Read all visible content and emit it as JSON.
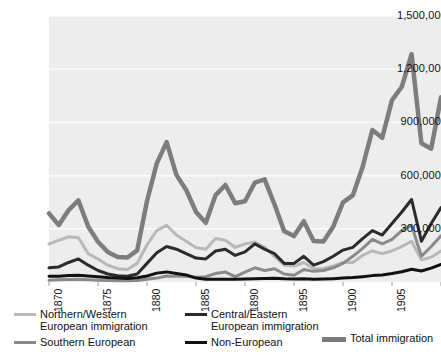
{
  "chart_data": {
    "type": "line",
    "title": "",
    "xlabel": "",
    "ylabel": "",
    "xlim": [
      1870,
      1910
    ],
    "ylim": [
      0,
      1500000
    ],
    "grid": true,
    "legend_position": "bottom",
    "y_ticks": [
      "1,500,000",
      "1,200,000",
      "900,000",
      "600,000",
      "300,000"
    ],
    "y_tick_values": [
      1500000,
      1200000,
      900000,
      600000,
      300000
    ],
    "x_ticks": [
      "1870",
      "1875",
      "1880",
      "1885",
      "1890",
      "1895",
      "1900",
      "1905",
      "1910"
    ],
    "x_tick_values": [
      1870,
      1875,
      1880,
      1885,
      1890,
      1895,
      1900,
      1905,
      1910
    ],
    "x": [
      1870,
      1871,
      1872,
      1873,
      1874,
      1875,
      1876,
      1877,
      1878,
      1879,
      1880,
      1881,
      1882,
      1883,
      1884,
      1885,
      1886,
      1887,
      1888,
      1889,
      1890,
      1891,
      1892,
      1893,
      1894,
      1895,
      1896,
      1897,
      1898,
      1899,
      1900,
      1901,
      1902,
      1903,
      1904,
      1905,
      1906,
      1907,
      1908,
      1909,
      1910
    ],
    "series": [
      {
        "name": "Northern/Western European immigration",
        "color": "#b9b9b9",
        "width": 3,
        "values": [
          215000,
          235000,
          255000,
          250000,
          160000,
          130000,
          95000,
          75000,
          70000,
          105000,
          210000,
          290000,
          320000,
          265000,
          230000,
          195000,
          185000,
          245000,
          235000,
          195000,
          215000,
          225000,
          195000,
          145000,
          95000,
          90000,
          110000,
          75000,
          75000,
          90000,
          110000,
          110000,
          150000,
          175000,
          160000,
          175000,
          200000,
          230000,
          125000,
          140000,
          175000
        ]
      },
      {
        "name": "Southern European",
        "color": "#8a8a8a",
        "width": 3,
        "values": [
          10000,
          12000,
          14000,
          15000,
          12000,
          10000,
          8000,
          7000,
          7000,
          9000,
          16000,
          22000,
          34000,
          33000,
          32000,
          27000,
          30000,
          48000,
          56000,
          30000,
          56000,
          80000,
          65000,
          75000,
          45000,
          38000,
          70000,
          60000,
          65000,
          80000,
          105000,
          145000,
          190000,
          240000,
          215000,
          240000,
          290000,
          320000,
          145000,
          200000,
          260000
        ]
      },
      {
        "name": "Central/Eastern European immigration",
        "color": "#2b2b2b",
        "width": 3,
        "values": [
          80000,
          85000,
          110000,
          130000,
          95000,
          65000,
          45000,
          35000,
          32000,
          45000,
          105000,
          165000,
          200000,
          185000,
          160000,
          135000,
          130000,
          175000,
          185000,
          150000,
          170000,
          215000,
          185000,
          160000,
          105000,
          105000,
          145000,
          95000,
          115000,
          145000,
          180000,
          195000,
          245000,
          290000,
          265000,
          330000,
          395000,
          465000,
          230000,
          330000,
          420000
        ]
      },
      {
        "name": "Non-European",
        "color": "#111111",
        "width": 3,
        "values": [
          32000,
          33000,
          36000,
          38000,
          34000,
          30000,
          25000,
          22000,
          20000,
          24000,
          34000,
          50000,
          57000,
          48000,
          40000,
          22000,
          16000,
          15000,
          16000,
          15000,
          17000,
          19000,
          20000,
          21000,
          18000,
          17000,
          18000,
          16000,
          17000,
          19000,
          22000,
          25000,
          30000,
          36000,
          40000,
          48000,
          58000,
          72000,
          62000,
          78000,
          100000
        ]
      },
      {
        "name": "Total immigration",
        "color": "#7d7d7d",
        "width": 4.5,
        "values": [
          387000,
          321000,
          405000,
          460000,
          313000,
          227000,
          169000,
          141000,
          138000,
          178000,
          457000,
          669000,
          789000,
          604000,
          519000,
          395000,
          334000,
          490000,
          547000,
          444000,
          455000,
          560000,
          579000,
          440000,
          286000,
          259000,
          343000,
          231000,
          229000,
          312000,
          449000,
          488000,
          649000,
          857000,
          813000,
          1026000,
          1101000,
          1285000,
          782000,
          752000,
          1041000
        ]
      }
    ]
  },
  "legend": {
    "entries": [
      {
        "label": "Northern/Western\nEuropean immigration",
        "swatch": "legend-line-northern-western",
        "color": "#b9b9b9",
        "style": "thin"
      },
      {
        "label": "Central/Eastern\nEuropean immigration",
        "swatch": "legend-line-central-eastern",
        "color": "#2b2b2b",
        "style": "thin"
      },
      {
        "label": "Total immigration",
        "swatch": "legend-line-total",
        "color": "#7d7d7d",
        "style": "thick"
      },
      {
        "label": "Southern European",
        "swatch": "legend-line-southern",
        "color": "#8a8a8a",
        "style": "thin"
      },
      {
        "label": "Non-European",
        "swatch": "legend-line-non-european",
        "color": "#111111",
        "style": "thin"
      }
    ]
  }
}
